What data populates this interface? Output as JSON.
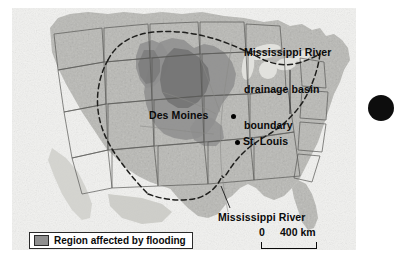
{
  "figure": {
    "type": "thematic-map"
  },
  "map": {
    "basin_label": {
      "line1": "Mississippi River",
      "line2": "drainage basin",
      "line3": "boundary"
    },
    "river_label": "Mississippi River",
    "cities": [
      {
        "name": "Des Moines",
        "marker": "city-dot"
      },
      {
        "name": "St. Louis",
        "marker": "city-dot"
      }
    ]
  },
  "scale": {
    "zero": "0",
    "max": "400 km",
    "units": "km",
    "max_value": 400
  },
  "legend": {
    "swatch_label": "Region affected by flooding",
    "swatch_color": "#8f8f8f"
  },
  "colors": {
    "land": "#b9b9b5",
    "ocean": "#f2f2f0",
    "flood_region": "#8f8f8f",
    "flood_core": "#6f6f6f",
    "border": "#4a4a48",
    "basin_boundary": "#2a2a28",
    "text": "#0a0a0a",
    "edge_mark": "#0d0d0d"
  },
  "icons": {
    "city_marker": "filled-circle-icon",
    "basin_boundary": "dashed-line-icon",
    "scale_bar": "scale-bar-icon"
  }
}
